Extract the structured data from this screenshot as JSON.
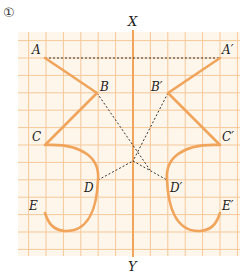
{
  "problem_number": "①",
  "axis": {
    "top_label": "X",
    "bottom_label": "Y"
  },
  "colors": {
    "background": "#FEF6EA",
    "grid": "#F5C89A",
    "stroke": "#F0A45C",
    "axis": "#F0A45C",
    "dotted": "#333333",
    "text": "#222222"
  },
  "points": {
    "A": {
      "label": "A",
      "x": 45,
      "y": 58
    },
    "B": {
      "label": "B",
      "x": 97,
      "y": 93
    },
    "C": {
      "label": "C",
      "x": 45,
      "y": 145
    },
    "D": {
      "label": "D",
      "x": 98,
      "y": 180
    },
    "E": {
      "label": "E",
      "x": 45,
      "y": 213
    },
    "A_prime": {
      "label": "A′",
      "x": 220,
      "y": 58
    },
    "B_prime": {
      "label": "B′",
      "x": 168,
      "y": 93
    },
    "C_prime": {
      "label": "C′",
      "x": 220,
      "y": 145
    },
    "D_prime": {
      "label": "D′",
      "x": 167,
      "y": 180
    },
    "E_prime": {
      "label": "E′",
      "x": 220,
      "y": 213
    }
  },
  "intersection": {
    "x": 133,
    "y": 161
  }
}
